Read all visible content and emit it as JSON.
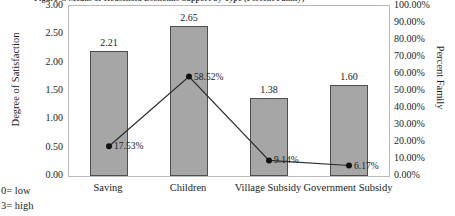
{
  "title_clipped": "Figure 4. Means of Household Economic Support by Type (Percent Family)",
  "footnotes": [
    "0= low",
    "3= high"
  ],
  "left_axis": {
    "title": "Degree of Satisfaction",
    "ticks": [
      "3.00",
      "2.50",
      "2.00",
      "1.50",
      "1.00",
      "0.50",
      "0.00"
    ]
  },
  "right_axis": {
    "title": "Percent Family",
    "ticks": [
      "100.00%",
      "90.00%",
      "80.00%",
      "70.00%",
      "60.00%",
      "50.00%",
      "40.00%",
      "30.00%",
      "20.00%",
      "10.00%",
      "0.00%"
    ]
  },
  "colors": {
    "bar_fill": "#a6a6a6",
    "bar_border": "#4e4e4e",
    "line": "#2b2b2b",
    "marker": "#111111",
    "plot_border": "#b9b9b9",
    "text": "#1b1b1b"
  },
  "chart_data": {
    "type": "bar",
    "title": "Figure 4. Means of Household Economic Support by Type (Percent Family)",
    "xlabel": "",
    "ylabel": "Degree of Satisfaction",
    "y2label": "Percent Family",
    "ylim": [
      0,
      3
    ],
    "y2lim": [
      0,
      100
    ],
    "grid": false,
    "legend": "none",
    "categories": [
      "Saving",
      "Children",
      "Village Subsidy",
      "Government Subsidy"
    ],
    "series": [
      {
        "name": "Degree of Satisfaction",
        "type": "bar",
        "axis": "left",
        "values": [
          2.21,
          2.65,
          1.38,
          1.6
        ],
        "labels": [
          "2.21",
          "2.65",
          "1.38",
          "1.60"
        ]
      },
      {
        "name": "Percent Family",
        "type": "line",
        "axis": "right",
        "values": [
          17.53,
          58.52,
          9.14,
          6.17
        ],
        "labels": [
          "17.53%",
          "58.52%",
          "9.14%",
          "6.17%"
        ]
      }
    ]
  }
}
